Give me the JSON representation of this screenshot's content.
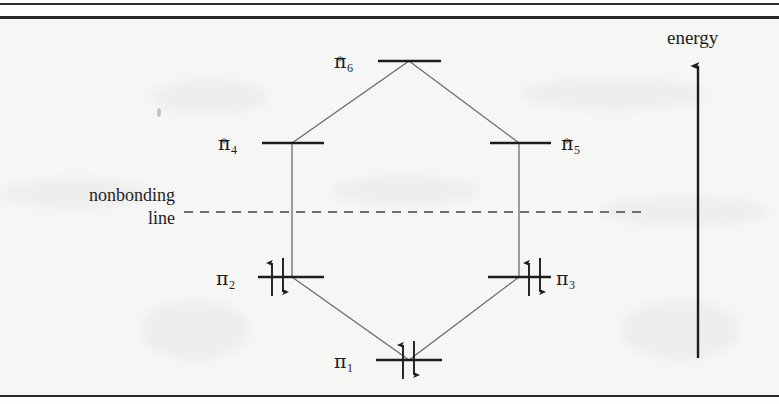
{
  "page": {
    "background_color": "#f6f6f4",
    "rule_color": "#2a2a2a",
    "ink_color": "#1d1d1d"
  },
  "diagram": {
    "axis": {
      "label": "energy",
      "direction": "up"
    },
    "nonbonding": {
      "label_line_1": "nonbonding",
      "label_line_2": "line",
      "style": "dashed"
    },
    "levels": [
      {
        "id": "pi6star",
        "pi": "π",
        "subscript": "6",
        "superscript": "*",
        "electrons": 0,
        "arrows": [],
        "tier": "antibonding",
        "label_side": "left"
      },
      {
        "id": "pi4star",
        "pi": "π",
        "subscript": "4",
        "superscript": "*",
        "electrons": 0,
        "arrows": [],
        "tier": "antibonding",
        "label_side": "left"
      },
      {
        "id": "pi5star",
        "pi": "π",
        "subscript": "5",
        "superscript": "*",
        "electrons": 0,
        "arrows": [],
        "tier": "antibonding",
        "label_side": "right"
      },
      {
        "id": "pi2",
        "pi": "π",
        "subscript": "2",
        "superscript": "",
        "electrons": 2,
        "arrows": [
          "up",
          "down"
        ],
        "tier": "bonding",
        "label_side": "left"
      },
      {
        "id": "pi3",
        "pi": "π",
        "subscript": "3",
        "superscript": "",
        "electrons": 2,
        "arrows": [
          "up",
          "down"
        ],
        "tier": "bonding",
        "label_side": "right"
      },
      {
        "id": "pi1",
        "pi": "π",
        "subscript": "1",
        "superscript": "",
        "electrons": 2,
        "arrows": [
          "up",
          "down"
        ],
        "tier": "bonding",
        "label_side": "left"
      }
    ]
  }
}
